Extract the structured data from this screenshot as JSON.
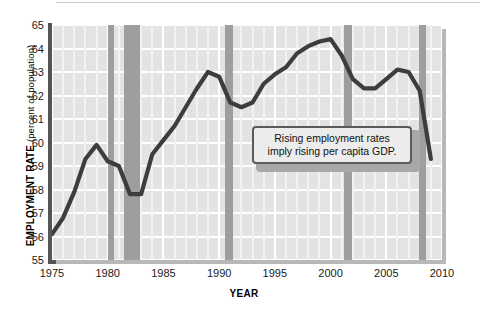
{
  "chart_data": {
    "type": "line",
    "title": "",
    "xlabel": "YEAR",
    "ylabel": "EMPLOYMENT RATE",
    "ylabel_unit": "(percent of population)",
    "xlim": [
      1975,
      2010
    ],
    "ylim": [
      55,
      65
    ],
    "grid": true,
    "legend": "none",
    "ytick_labels": [
      "65",
      "64",
      "63",
      "62",
      "61",
      "60",
      "59",
      "58",
      "57",
      "56",
      "55"
    ],
    "ytick_values": [
      65,
      64,
      63,
      62,
      61,
      60,
      59,
      58,
      57,
      56,
      55
    ],
    "xtick_labels": [
      "1975",
      "1980",
      "1985",
      "1990",
      "1995",
      "2000",
      "2005",
      "2010"
    ],
    "xtick_values": [
      1975,
      1980,
      1985,
      1990,
      1995,
      2000,
      2005,
      2010
    ],
    "series": [
      {
        "name": "Employment rate",
        "color": "#3d3d3d",
        "x": [
          1975,
          1976,
          1977,
          1978,
          1979,
          1980,
          1981,
          1982,
          1983,
          1984,
          1985,
          1986,
          1987,
          1988,
          1989,
          1990,
          1991,
          1992,
          1993,
          1994,
          1995,
          1996,
          1997,
          1998,
          1999,
          2000,
          2001,
          2002,
          2003,
          2004,
          2005,
          2006,
          2007,
          2008,
          2009
        ],
        "values": [
          56.1,
          56.8,
          57.9,
          59.3,
          59.9,
          59.2,
          59.0,
          57.8,
          57.8,
          59.5,
          60.1,
          60.7,
          61.5,
          62.3,
          63.0,
          62.8,
          61.7,
          61.5,
          61.7,
          62.5,
          62.9,
          63.2,
          63.8,
          64.1,
          64.3,
          64.4,
          63.7,
          62.7,
          62.3,
          62.3,
          62.7,
          63.1,
          63.0,
          62.2,
          59.3
        ],
        "note": "Values read from gridlines; percent of population"
      }
    ],
    "recession_bands": [
      {
        "label": "1980 recession",
        "start": 1980.0,
        "end": 1980.6
      },
      {
        "label": "1981-82 recession",
        "start": 1981.5,
        "end": 1982.9
      },
      {
        "label": "1990-91 recession",
        "start": 1990.5,
        "end": 1991.2
      },
      {
        "label": "2001 recession",
        "start": 2001.2,
        "end": 2001.9
      },
      {
        "label": "2008-09 recession",
        "start": 2007.9,
        "end": 2008.6
      }
    ],
    "band_color": "#9e9e9e",
    "plot_background": "#e3e3e3",
    "gridline_color": "#ffffff",
    "annotations": [
      {
        "name": "employment-gdp-callout",
        "line1": "Rising employment rates",
        "line2": "imply rising per capita GDP."
      }
    ]
  }
}
